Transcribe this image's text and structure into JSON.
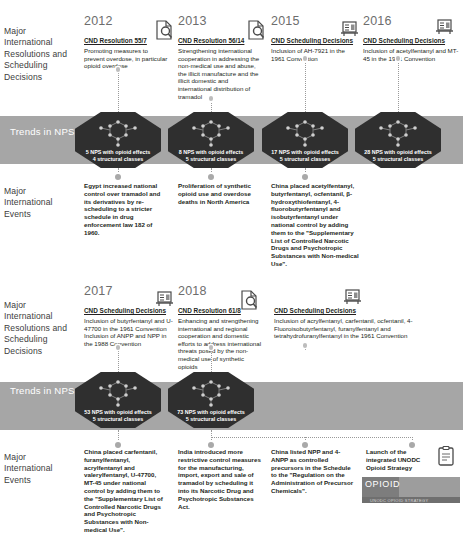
{
  "rows": {
    "resolutions_label": "Major International Resolutions and Scheduling Decisions",
    "trends_label": "Trends in NPS Opioids",
    "events_label": "Major International Events"
  },
  "colors": {
    "band": "#a6a6a6",
    "node": "#2f2f2f",
    "year": "#6d6d6d",
    "connector": "#9a9a9a",
    "text": "#231f20"
  },
  "section1": {
    "columns": [
      {
        "year": "2012",
        "resolution_title": "CND Resolution 55/7",
        "resolution_body": "Promoting measures to prevent overdose, in particular opioid overdose",
        "icon": "document-search-icon",
        "trend_line1": "5 NPS with opioid effects",
        "trend_line2": "4 structural classes",
        "event": "Egypt increased national control over tramadol and its derivatives by re-scheduling to a stricter schedule in drug enforcement law 182 of 1960."
      },
      {
        "year": "2013",
        "resolution_title": "CND Resolution 56/14",
        "resolution_body": "Strengthening international cooperation in addressing the non-medical use and abuse, the illicit manufacture and the illicit domestic and international distribution of tramadol",
        "icon": "document-search-icon",
        "trend_line1": "8 NPS with opioid effects",
        "trend_line2": "5 structural classes",
        "event": "Proliferation of synthetic opioid use and overdose deaths in North America"
      },
      {
        "year": "2015",
        "resolution_title": "CND Scheduling Decisions",
        "resolution_body": "Inclusion of AH-7921 in the 1961 Convention",
        "icon": "scheduling-board-icon",
        "trend_line1": "17 NPS with opioid effects",
        "trend_line2": "5 structural classes",
        "event": "China placed acetylfentanyl, butyrfentanyl, ocfentanil, β-hydroxythiofentanyl, 4-fluorobutyrfentanyl and isobutyrfentanyl under national control by adding them to the \"Supplementary List of Controlled Narcotic Drugs and Psychotropic Substances with Non-medical Use\"."
      },
      {
        "year": "2016",
        "resolution_title": "CND Scheduling Decisions",
        "resolution_body": "Inclusion of acetylfentanyl and MT-45 in the 1961 Convention",
        "icon": "scheduling-board-icon",
        "trend_line1": "28 NPS with opioid effects",
        "trend_line2": "5 structural classes",
        "event": ""
      }
    ]
  },
  "section2": {
    "columns": [
      {
        "year": "2017",
        "resolution_title": "CND Scheduling Decisions",
        "resolution_body": "Inclusion of butyrfentanyl and U-47700 in the 1961 Convention\nInclusion of ANPP and NPP in the 1988 Convention",
        "icon": "scheduling-board-icon",
        "trend_line1": "53 NPS with opioid effects",
        "trend_line2": "5 structural classes",
        "event": "China placed carfentanil, furanylfentanyl, acrylfentanyl and valerylfentanyl, U-47700, MT-45 under national control by adding them to the \"Supplementary List of Controlled Narcotic Drugs and Psychotropic Substances with Non-medical Use\"."
      },
      {
        "year": "2018",
        "resolution_title": "CND Resolution 61/8",
        "resolution_body": "Enhancing and strengthening international and regional cooperation and domestic efforts to address international threats posed by the non-medical use of synthetic opioids",
        "icon": "document-search-icon",
        "trend_line1": "73 NPS with opioid effects",
        "trend_line2": "5 structural classes",
        "event": "India introduced more restrictive control measures for the manufacturing, import, export and sale of tramadol by scheduling it into its Narcotic Drug and Psychotropic Substances Act."
      },
      {
        "year": "",
        "resolution_title": "CND Scheduling Decisions",
        "resolution_body": "Inclusion of acrylfentanyl, carfentanil, ocfentanil, 4-Fluoroisobutyrfentanyl, furanylfentanyl and tetrahydrofuranylfentanyl in the 1961 Convention",
        "icon": "scheduling-board-icon",
        "trend_line1": "",
        "trend_line2": "",
        "event": "China listed NPP and 4-ANPP as controlled precursors in the Schedule to the \"Regulation on the Administration of Precursor Chemicals\"."
      },
      {
        "year": "",
        "resolution_title": "",
        "resolution_body": "",
        "icon": "clipboard-checklist-icon",
        "trend_line1": "",
        "trend_line2": "",
        "event": "Launch of the integrated UNODC Opioid Strategy"
      }
    ],
    "logo": {
      "title": "OPIOID",
      "subtitle": "UNODC OPIOID STRATEGY"
    }
  }
}
